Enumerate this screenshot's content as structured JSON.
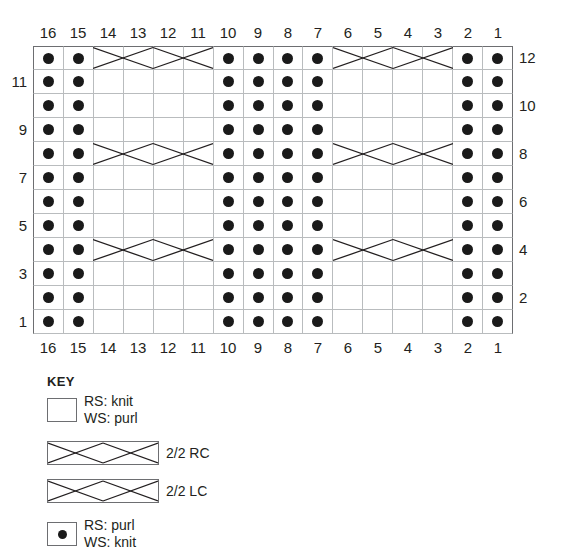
{
  "chart": {
    "columns": 16,
    "rows": 12,
    "column_labels_top": [
      "16",
      "15",
      "14",
      "13",
      "12",
      "11",
      "10",
      "9",
      "8",
      "7",
      "6",
      "5",
      "4",
      "3",
      "2",
      "1"
    ],
    "column_labels_bottom": [
      "16",
      "15",
      "14",
      "13",
      "12",
      "11",
      "10",
      "9",
      "8",
      "7",
      "6",
      "5",
      "4",
      "3",
      "2",
      "1"
    ],
    "row_labels_left": [
      "11",
      "9",
      "7",
      "5",
      "3",
      "1"
    ],
    "row_labels_right": [
      "12",
      "10",
      "8",
      "6",
      "4",
      "2"
    ],
    "purl_columns": [
      16,
      15,
      10,
      9,
      8,
      7,
      2,
      1
    ],
    "knit_columns": [
      14,
      13,
      12,
      11,
      6,
      5,
      4,
      3
    ],
    "cable_rows": [
      12,
      8,
      4
    ],
    "cable_spans": [
      {
        "start_col": 14,
        "end_col": 11,
        "symbols": [
          "2/2 RC",
          "2/2 LC"
        ]
      },
      {
        "start_col": 6,
        "end_col": 3,
        "symbols": [
          "2/2 RC",
          "2/2 LC"
        ]
      }
    ],
    "grid_line_color": "#b9bcbe",
    "border_color": "#6d6e71",
    "dot_color": "#1a1a1a"
  },
  "chart_data": {
    "type": "table",
    "xlabel": "Stitch number",
    "ylabel": "Row number",
    "categories": [
      "16",
      "15",
      "14",
      "13",
      "12",
      "11",
      "10",
      "9",
      "8",
      "7",
      "6",
      "5",
      "4",
      "3",
      "2",
      "1"
    ],
    "row_order_bottom_to_top": [
      "1",
      "2",
      "3",
      "4",
      "5",
      "6",
      "7",
      "8",
      "9",
      "10",
      "11",
      "12"
    ],
    "legend": [
      "RS: knit / WS: purl",
      "2/2 RC",
      "2/2 LC",
      "RS: purl / WS: knit"
    ],
    "cells": {
      "12": [
        "p",
        "p",
        "c",
        "c",
        "c",
        "c",
        "p",
        "p",
        "p",
        "p",
        "c",
        "c",
        "c",
        "c",
        "p",
        "p"
      ],
      "11": [
        "p",
        "p",
        "k",
        "k",
        "k",
        "k",
        "p",
        "p",
        "p",
        "p",
        "k",
        "k",
        "k",
        "k",
        "p",
        "p"
      ],
      "10": [
        "p",
        "p",
        "k",
        "k",
        "k",
        "k",
        "p",
        "p",
        "p",
        "p",
        "k",
        "k",
        "k",
        "k",
        "p",
        "p"
      ],
      "9": [
        "p",
        "p",
        "k",
        "k",
        "k",
        "k",
        "p",
        "p",
        "p",
        "p",
        "k",
        "k",
        "k",
        "k",
        "p",
        "p"
      ],
      "8": [
        "p",
        "p",
        "c",
        "c",
        "c",
        "c",
        "p",
        "p",
        "p",
        "p",
        "c",
        "c",
        "c",
        "c",
        "p",
        "p"
      ],
      "7": [
        "p",
        "p",
        "k",
        "k",
        "k",
        "k",
        "p",
        "p",
        "p",
        "p",
        "k",
        "k",
        "k",
        "k",
        "p",
        "p"
      ],
      "6": [
        "p",
        "p",
        "k",
        "k",
        "k",
        "k",
        "p",
        "p",
        "p",
        "p",
        "k",
        "k",
        "k",
        "k",
        "p",
        "p"
      ],
      "5": [
        "p",
        "p",
        "k",
        "k",
        "k",
        "k",
        "p",
        "p",
        "p",
        "p",
        "k",
        "k",
        "k",
        "k",
        "p",
        "p"
      ],
      "4": [
        "p",
        "p",
        "c",
        "c",
        "c",
        "c",
        "p",
        "p",
        "p",
        "p",
        "c",
        "c",
        "c",
        "c",
        "p",
        "p"
      ],
      "3": [
        "p",
        "p",
        "k",
        "k",
        "k",
        "k",
        "p",
        "p",
        "p",
        "p",
        "k",
        "k",
        "k",
        "k",
        "p",
        "p"
      ],
      "2": [
        "p",
        "p",
        "k",
        "k",
        "k",
        "k",
        "p",
        "p",
        "p",
        "p",
        "k",
        "k",
        "k",
        "k",
        "p",
        "p"
      ],
      "1": [
        "p",
        "p",
        "k",
        "k",
        "k",
        "k",
        "p",
        "p",
        "p",
        "p",
        "k",
        "k",
        "k",
        "k",
        "p",
        "p"
      ]
    },
    "legend_position": "below"
  },
  "key": {
    "title": "KEY",
    "entries": [
      {
        "symbol": "blank-square",
        "line1": "RS: knit",
        "line2": "WS: purl"
      },
      {
        "symbol": "cable-rc",
        "line1": "2/2 RC",
        "line2": ""
      },
      {
        "symbol": "cable-lc",
        "line1": "2/2 LC",
        "line2": ""
      },
      {
        "symbol": "dot-square",
        "line1": "RS: purl",
        "line2": "WS: knit"
      }
    ]
  }
}
